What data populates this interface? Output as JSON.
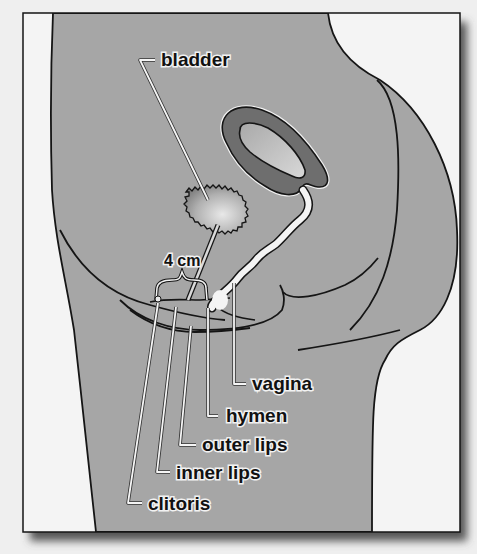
{
  "figure": {
    "type": "anatomical-diagram",
    "colors": {
      "page_background": "#efefef",
      "frame_fill": "#f4f4f4",
      "body_fill": "#a6a6a6",
      "uterus_wall": "#6e6e6e",
      "uterus_cavity": "#bdbdbd",
      "outline": "#151515",
      "leader_line": "#f5f5f5",
      "shadow": "#555555"
    }
  },
  "labels": {
    "bladder": "bladder",
    "measurement": "4 cm",
    "vagina": "vagina",
    "hymen": "hymen",
    "outer_lips": "outer lips",
    "inner_lips": "inner lips",
    "clitoris": "clitoris"
  }
}
